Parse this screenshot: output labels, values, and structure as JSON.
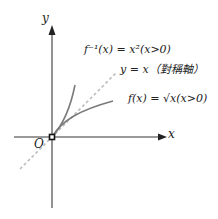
{
  "diagram": {
    "axes": {
      "x_label": "x",
      "y_label": "y",
      "origin_label": "O"
    },
    "curves": [
      {
        "name": "inverse",
        "label": "f⁻¹(x) = x²(x>0)",
        "color": "#7a7a7a"
      },
      {
        "name": "symmetry-line",
        "label": "y = x（對稱軸）",
        "color": "#b8b8b8",
        "style": "dashed"
      },
      {
        "name": "function",
        "label": "f(x) = √x(x>0)",
        "color": "#7a7a7a"
      }
    ]
  }
}
